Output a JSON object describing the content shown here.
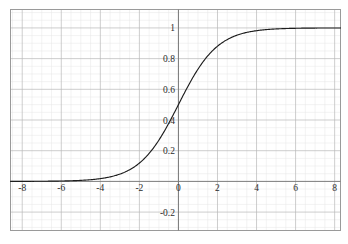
{
  "chart_data": {
    "type": "line",
    "title": "",
    "subtitle": "",
    "xlabel": "",
    "ylabel": "",
    "function": "sigmoid",
    "expression": "1 / (1 + exp(-x))",
    "xlim": [
      -8.6,
      8.3
    ],
    "ylim": [
      -0.32,
      1.12
    ],
    "grid": true,
    "legend": null,
    "legend_position": "none",
    "x_ticks": [
      -8,
      -6,
      -4,
      -2,
      0,
      2,
      4,
      6,
      8
    ],
    "x_tick_labels": [
      "-8",
      "-6",
      "-4",
      "-2",
      "0",
      "2",
      "4",
      "6",
      "8"
    ],
    "y_ticks": [
      -0.2,
      0.2,
      0.4,
      0.6,
      0.8,
      1
    ],
    "y_tick_labels": [
      "-0.2",
      "0.2",
      "0.4",
      "0.6",
      "0.8",
      "1"
    ],
    "x_minor_step": 0.5,
    "y_minor_step": 0.05,
    "x_major_step": 2,
    "y_major_step": 0.2,
    "series": [
      {
        "name": "sigmoid",
        "color": "#1d1d1d",
        "x": [
          -8.6,
          -8,
          -7.5,
          -7,
          -6.5,
          -6,
          -5.5,
          -5,
          -4.5,
          -4,
          -3.5,
          -3,
          -2.5,
          -2,
          -1.5,
          -1,
          -0.5,
          0,
          0.5,
          1,
          1.5,
          2,
          2.5,
          3,
          3.5,
          4,
          4.5,
          5,
          5.5,
          6,
          6.5,
          7,
          7.5,
          8,
          8.3
        ],
        "values": [
          0.0002,
          0.0003,
          0.0006,
          0.0009,
          0.0015,
          0.0025,
          0.0041,
          0.0067,
          0.011,
          0.018,
          0.029,
          0.047,
          0.076,
          0.119,
          0.182,
          0.269,
          0.378,
          0.5,
          0.622,
          0.731,
          0.818,
          0.881,
          0.924,
          0.953,
          0.971,
          0.982,
          0.989,
          0.993,
          0.996,
          0.998,
          0.998,
          0.999,
          0.999,
          1.0,
          1.0
        ]
      }
    ],
    "annotations": []
  },
  "colors": {
    "curve": "#1d1d1d",
    "axis": "#7a7a7a",
    "frame": "#9a9a9a",
    "grid_major": "#b8b8b8",
    "grid_minor": "#e6e6e6",
    "background": "#ffffff",
    "tick_text": "#2b2b2b"
  },
  "x_tick_items": [
    {
      "label": "-8"
    },
    {
      "label": "-6"
    },
    {
      "label": "-4"
    },
    {
      "label": "-2"
    },
    {
      "label": "0"
    },
    {
      "label": "2"
    },
    {
      "label": "4"
    },
    {
      "label": "6"
    },
    {
      "label": "8"
    }
  ],
  "y_tick_items": [
    {
      "label": "1"
    },
    {
      "label": "0.8"
    },
    {
      "label": "0.6"
    },
    {
      "label": "0.4"
    },
    {
      "label": "0.2"
    },
    {
      "label": "-0.2"
    }
  ]
}
